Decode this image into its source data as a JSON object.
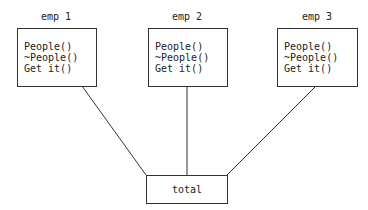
{
  "nodes": [
    {
      "title": "emp 1",
      "methods": [
        "People()",
        "~People()",
        "Get it()"
      ]
    },
    {
      "title": "emp 2",
      "methods": [
        "People()",
        "~People()",
        "Get it()"
      ]
    },
    {
      "title": "emp 3",
      "methods": [
        "People()",
        "~People()",
        "Get it()"
      ]
    }
  ],
  "total": {
    "label": "total"
  },
  "colors": {
    "stroke": "#333333",
    "background": "#ffffff"
  }
}
